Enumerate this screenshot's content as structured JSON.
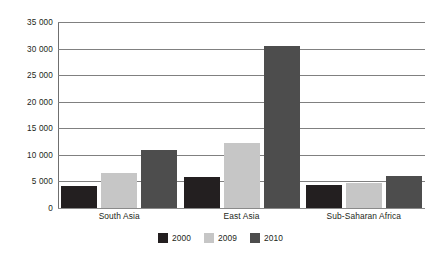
{
  "chart_data": {
    "type": "bar",
    "title": "",
    "subtitle": "",
    "xlabel": "",
    "ylabel": "",
    "categories": [
      "South Asia",
      "East Asia",
      "Sub-Saharan Africa"
    ],
    "series": [
      {
        "name": "2000",
        "color": "#231f20",
        "values": [
          4200,
          5800,
          4300
        ]
      },
      {
        "name": "2009",
        "color": "#c6c6c6",
        "values": [
          6500,
          12300,
          4800
        ]
      },
      {
        "name": "2010",
        "color": "#4d4d4d",
        "values": [
          11000,
          30400,
          6100
        ]
      }
    ],
    "ylim": [
      0,
      35000
    ],
    "yticks": [
      0,
      5000,
      10000,
      15000,
      20000,
      25000,
      30000,
      35000
    ],
    "ytick_labels": [
      "0",
      "5 000",
      "10 000",
      "15 000",
      "20 000",
      "25 000",
      "30 000",
      "35 000"
    ],
    "grid": true,
    "grid_axis": "y",
    "legend_position": "bottom",
    "legend_entries": [
      "2000",
      "2009",
      "2010"
    ],
    "background_color": "#ffffff",
    "gridline_color": "#808080",
    "axis_color": "#6f6f6f"
  }
}
